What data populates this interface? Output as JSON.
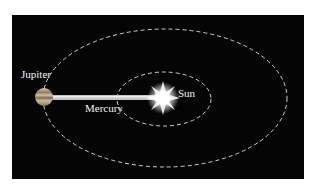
{
  "diagram": {
    "background_color": "#050505",
    "labels": {
      "jupiter": "Jupiter",
      "mercury": "Mercury",
      "sun": "Sun"
    },
    "colors": {
      "orbit": "#cfcfcf",
      "beam": "#bdbdbd",
      "sun": "#ffffff",
      "jupiter": "#b8a88e"
    }
  }
}
